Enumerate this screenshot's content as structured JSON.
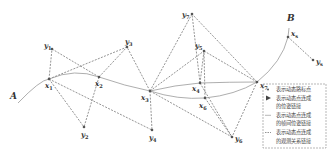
{
  "diagram": {
    "start_label": "A",
    "end_label": "B",
    "pose_nodes": [
      {
        "id": "x1",
        "label": "x",
        "sub": "1"
      },
      {
        "id": "x2",
        "label": "x",
        "sub": "2"
      },
      {
        "id": "x3",
        "label": "x",
        "sub": "3"
      },
      {
        "id": "x4",
        "label": "x",
        "sub": "4"
      },
      {
        "id": "x6",
        "label": "x",
        "sub": "6"
      },
      {
        "id": "x7",
        "label": "x",
        "sub": "7"
      },
      {
        "id": "xs",
        "label": "x",
        "sub": "s"
      }
    ],
    "landmark_nodes": [
      {
        "id": "y1",
        "label": "y",
        "sub": "1"
      },
      {
        "id": "y2",
        "label": "y",
        "sub": "2"
      },
      {
        "id": "y3",
        "label": "y",
        "sub": "3"
      },
      {
        "id": "y4",
        "label": "y",
        "sub": "4"
      },
      {
        "id": "y5",
        "label": "y",
        "sub": "5"
      },
      {
        "id": "y6",
        "label": "y",
        "sub": "6"
      },
      {
        "id": "y7",
        "label": "y",
        "sub": "7"
      },
      {
        "id": "ys",
        "label": "y",
        "sub": "s"
      }
    ],
    "trajectory": [
      "x1",
      "x2",
      "x3",
      "x4",
      "x7",
      "xs"
    ],
    "secondary_trajectory": [
      "x3",
      "x6",
      "x7"
    ],
    "observations": [
      [
        "x1",
        "y1"
      ],
      [
        "x1",
        "y3"
      ],
      [
        "x1",
        "y2"
      ],
      [
        "x1",
        "y4"
      ],
      [
        "x2",
        "y1"
      ],
      [
        "x2",
        "y3"
      ],
      [
        "x2",
        "y2"
      ],
      [
        "x3",
        "y3"
      ],
      [
        "x3",
        "y4"
      ],
      [
        "x3",
        "y5"
      ],
      [
        "x3",
        "y7"
      ],
      [
        "x3",
        "y6"
      ],
      [
        "x4",
        "y5"
      ],
      [
        "x4",
        "y7"
      ],
      [
        "x4",
        "y6"
      ],
      [
        "x6",
        "y5"
      ],
      [
        "x6",
        "y6"
      ],
      [
        "x7",
        "y5"
      ],
      [
        "x7",
        "y7"
      ],
      [
        "x7",
        "y6"
      ],
      [
        "xs",
        "ys"
      ]
    ],
    "legend": {
      "items": [
        {
          "symbol": "dot",
          "text": "表示动态路标点"
        },
        {
          "symbol": "arrow",
          "text": "表示动态点连成"
        },
        {
          "symbol": "none",
          "text": "的位姿链接"
        },
        {
          "symbol": "solid-line",
          "text": "表示动态点连成"
        },
        {
          "symbol": "none",
          "text": "的帧间位姿链接"
        },
        {
          "symbol": "dashed-line",
          "text": "表示动态点连成"
        },
        {
          "symbol": "none",
          "text": "的观测关系链接"
        }
      ]
    },
    "colors": {
      "node": "#555555",
      "edge_dashed": "#666666",
      "trajectory": "#999999",
      "legend_border": "#888888"
    }
  }
}
